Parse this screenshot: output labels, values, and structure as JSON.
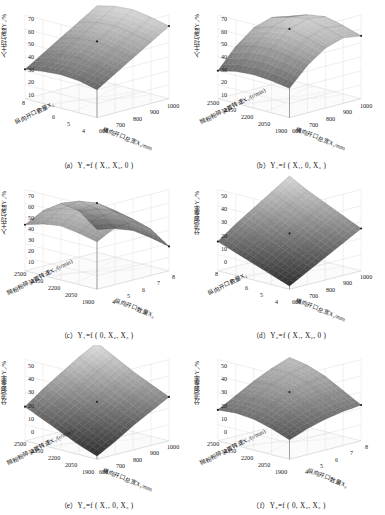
{
  "figure": {
    "layout": "2 columns x 3 rows",
    "panel_count": 6,
    "colormap": "grayscale"
  },
  "axis_titles": {
    "y1": "入土均匀度Y₁/%",
    "y2": "分流偏差率Y₂/%",
    "x1": "横向开口总宽X₁/mm",
    "x2": "纵向开口数量X₂",
    "x3": "抛粉粉碎装置转速X₃/(r/min)"
  },
  "ticks": {
    "y1": [
      "70",
      "60",
      "50",
      "40",
      "30",
      "20",
      "10"
    ],
    "y2": [
      "50",
      "40",
      "30",
      "20",
      "10",
      "0"
    ],
    "x1": [
      "600",
      "700",
      "800",
      "900",
      "1000"
    ],
    "x2": [
      "8",
      "7",
      "6",
      "5",
      "4"
    ],
    "x2_asc": [
      "4",
      "5",
      "6",
      "7",
      "8"
    ],
    "x3": [
      "2500",
      "2350",
      "2200",
      "2050",
      "1900"
    ]
  },
  "panels": [
    {
      "id": "a",
      "caption": "（a）Y₁=f ( X₁,  X₂,  0 )",
      "response": "y1",
      "left_axis": "x2",
      "right_axis": "x1",
      "chart_data": {
        "type": "surface",
        "title": "Y1 = f(X1, X2, 0)",
        "zlabel": "入土均匀度Y₁/%",
        "zlim": [
          10,
          70
        ],
        "zticks": [
          10,
          20,
          30,
          40,
          50,
          60,
          70
        ],
        "xlabel": "横向开口总宽X₁/mm",
        "x": [
          600,
          700,
          800,
          900,
          1000
        ],
        "ylabel": "纵向开口数量X₂",
        "y": [
          4,
          5,
          6,
          7,
          8
        ],
        "z": [
          [
            30,
            38,
            46,
            54,
            62
          ],
          [
            33,
            41,
            49,
            57,
            65
          ],
          [
            34,
            43,
            51,
            59,
            67
          ],
          [
            33,
            42,
            50,
            58,
            66
          ],
          [
            31,
            39,
            47,
            55,
            63
          ]
        ]
      }
    },
    {
      "id": "b",
      "caption": "（b）Y₁=f ( X₁,  0,  X₃ )",
      "response": "y1",
      "left_axis": "x3",
      "right_axis": "x1",
      "chart_data": {
        "type": "surface",
        "title": "Y1 = f(X1, 0, X3)",
        "zlabel": "入土均匀度Y₁/%",
        "zlim": [
          10,
          70
        ],
        "zticks": [
          10,
          20,
          30,
          40,
          50,
          60,
          70
        ],
        "xlabel": "横向开口总宽X₁/mm",
        "x": [
          600,
          700,
          800,
          900,
          1000
        ],
        "ylabel": "抛粉粉碎装置转速X₃/(r/min)",
        "y": [
          1900,
          2050,
          2200,
          2350,
          2500
        ],
        "z": [
          [
            31,
            44,
            53,
            57,
            55
          ],
          [
            33,
            47,
            57,
            61,
            59
          ],
          [
            34,
            49,
            60,
            64,
            62
          ],
          [
            33,
            48,
            58,
            62,
            60
          ],
          [
            30,
            44,
            54,
            58,
            55
          ]
        ]
      }
    },
    {
      "id": "c",
      "caption": "（c）Y₁=f ( 0,  X₂,  X₃ )",
      "response": "y1",
      "left_axis": "x3",
      "right_axis": "x2_asc",
      "chart_data": {
        "type": "surface",
        "title": "Y1 = f(0, X2, X3)",
        "zlabel": "入土均匀度Y₁/%",
        "zlim": [
          10,
          70
        ],
        "zticks": [
          10,
          20,
          30,
          40,
          50,
          60,
          70
        ],
        "xlabel": "纵向开口数量X₂",
        "x": [
          4,
          5,
          6,
          7,
          8
        ],
        "ylabel": "抛粉粉碎装置转速X₃/(r/min)",
        "y": [
          1900,
          2050,
          2200,
          2350,
          2500
        ],
        "z": [
          [
            45,
            52,
            53,
            44,
            28
          ],
          [
            48,
            56,
            57,
            48,
            31
          ],
          [
            50,
            58,
            60,
            51,
            33
          ],
          [
            48,
            56,
            58,
            49,
            31
          ],
          [
            44,
            51,
            53,
            44,
            27
          ]
        ]
      }
    },
    {
      "id": "d",
      "caption": "（d）Y₂=f ( X₁,  X₂,  0 )",
      "response": "y2",
      "left_axis": "x2",
      "right_axis": "x1",
      "chart_data": {
        "type": "surface",
        "title": "Y2 = f(X1, X2, 0)",
        "zlabel": "分流偏差率Y₂/%",
        "zlim": [
          0,
          50
        ],
        "zticks": [
          0,
          10,
          20,
          30,
          40,
          50
        ],
        "xlabel": "横向开口总宽X₁/mm",
        "x": [
          600,
          700,
          800,
          900,
          1000
        ],
        "ylabel": "纵向开口数量X₂",
        "y": [
          4,
          5,
          6,
          7,
          8
        ],
        "z": [
          [
            2,
            8,
            14,
            20,
            26
          ],
          [
            6,
            12,
            18,
            25,
            31
          ],
          [
            10,
            17,
            23,
            30,
            36
          ],
          [
            14,
            21,
            28,
            35,
            41
          ],
          [
            18,
            26,
            33,
            40,
            47
          ]
        ]
      }
    },
    {
      "id": "e",
      "caption": "（e）Y₂=f ( X₁,  0,  X₃ )",
      "response": "y2",
      "left_axis": "x3",
      "right_axis": "x1",
      "chart_data": {
        "type": "surface",
        "title": "Y2 = f(X1, 0, X3)",
        "zlabel": "分流偏差率Y₂/%",
        "zlim": [
          0,
          50
        ],
        "zticks": [
          0,
          10,
          20,
          30,
          40,
          50
        ],
        "xlabel": "横向开口总宽X₁/mm",
        "x": [
          600,
          700,
          800,
          900,
          1000
        ],
        "ylabel": "抛粉粉碎装置转速X₃/(r/min)",
        "y": [
          1900,
          2050,
          2200,
          2350,
          2500
        ],
        "z": [
          [
            2,
            8,
            15,
            21,
            27
          ],
          [
            6,
            13,
            19,
            26,
            32
          ],
          [
            11,
            18,
            24,
            31,
            37
          ],
          [
            16,
            23,
            30,
            37,
            43
          ],
          [
            21,
            29,
            36,
            43,
            49
          ]
        ]
      }
    },
    {
      "id": "f",
      "caption": "（f）Y₂=f ( 0,  X₂,  X₃ )",
      "response": "y2",
      "left_axis": "x3",
      "right_axis": "x2_asc",
      "chart_data": {
        "type": "surface",
        "title": "Y2 = f(0, X2, X3)",
        "zlabel": "分流偏差率Y₂/%",
        "zlim": [
          0,
          50
        ],
        "zticks": [
          0,
          10,
          20,
          30,
          40,
          50
        ],
        "xlabel": "纵向开口数量X₂",
        "x": [
          4,
          5,
          6,
          7,
          8
        ],
        "ylabel": "抛粉粉碎装置转速X₃/(r/min)",
        "y": [
          1900,
          2050,
          2200,
          2350,
          2500
        ],
        "z": [
          [
            12,
            16,
            19,
            21,
            22
          ],
          [
            16,
            21,
            25,
            27,
            28
          ],
          [
            19,
            25,
            30,
            33,
            34
          ],
          [
            20,
            26,
            32,
            36,
            38
          ],
          [
            19,
            25,
            31,
            36,
            40
          ]
        ]
      }
    }
  ]
}
